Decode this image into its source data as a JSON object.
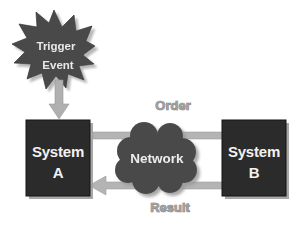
{
  "diagram": {
    "background_color": "#ffffff",
    "nodes": {
      "trigger": {
        "shape": "starburst",
        "line1": "Trigger",
        "line2": "Event",
        "fill_color": "#4a4a4a",
        "text_color": "#e8e8e8"
      },
      "system_a": {
        "shape": "rectangle",
        "line1": "System",
        "line2": "A",
        "fill_color": "#2b2b2b",
        "text_color": "#f2f2f2"
      },
      "system_b": {
        "shape": "rectangle",
        "line1": "System",
        "line2": "B",
        "fill_color": "#2b2b2b",
        "text_color": "#f2f2f2"
      },
      "network": {
        "shape": "cloud",
        "label": "Network",
        "fill_color": "#4a4a4a",
        "text_color": "#ededed"
      }
    },
    "connectors": {
      "trigger_to_system_a": {
        "label": "",
        "direction": "down",
        "color": "#a8a8a8"
      },
      "order": {
        "label": "Order",
        "direction": "right",
        "from": "System A",
        "to": "System B",
        "color": "#b0b0b0"
      },
      "result": {
        "label": "Result",
        "direction": "left",
        "from": "System B",
        "to": "System A",
        "color": "#b0b0b0"
      }
    }
  }
}
